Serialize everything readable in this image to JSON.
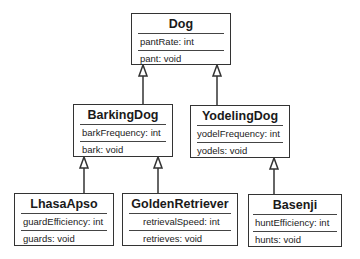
{
  "diagram": {
    "type": "uml-class-diagram",
    "classes": [
      {
        "id": "dog",
        "name": "Dog",
        "attribute": "pantRate: int",
        "method": "pant: void"
      },
      {
        "id": "barkingdog",
        "name": "BarkingDog",
        "attribute": "barkFrequency: int",
        "method": "bark: void"
      },
      {
        "id": "yodelingdog",
        "name": "YodelingDog",
        "attribute": "yodelFrequency: int",
        "method": "yodels: void"
      },
      {
        "id": "lhasaapso",
        "name": "LhasaApso",
        "attribute": "guardEfficiency: int",
        "method": "guards: void"
      },
      {
        "id": "goldenretriever",
        "name": "GoldenRetriever",
        "attribute": "retrievalSpeed: int",
        "method": "retrieves: void"
      },
      {
        "id": "basenji",
        "name": "Basenji",
        "attribute": "huntEfficiency: int",
        "method": "hunts: void"
      }
    ],
    "inheritance": [
      {
        "child": "BarkingDog",
        "parent": "Dog"
      },
      {
        "child": "YodelingDog",
        "parent": "Dog"
      },
      {
        "child": "LhasaApso",
        "parent": "BarkingDog"
      },
      {
        "child": "GoldenRetriever",
        "parent": "BarkingDog"
      },
      {
        "child": "Basenji",
        "parent": "YodelingDog"
      }
    ]
  }
}
